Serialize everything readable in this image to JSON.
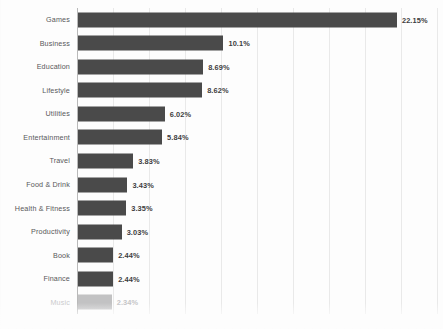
{
  "chart_data": {
    "type": "bar",
    "orientation": "horizontal",
    "title": "",
    "subtitle": "",
    "xlabel": "",
    "ylabel": "",
    "xlim": [
      0,
      25
    ],
    "grid": true,
    "legend": false,
    "value_suffix": "%",
    "categories": [
      "Games",
      "Business",
      "Education",
      "Lifestyle",
      "Utilities",
      "Entertainment",
      "Travel",
      "Food & Drink",
      "Health & Fitness",
      "Productivity",
      "Book",
      "Finance",
      "Music"
    ],
    "values": [
      22.15,
      10.1,
      8.69,
      8.62,
      6.02,
      5.84,
      3.83,
      3.43,
      3.35,
      3.03,
      2.44,
      2.44,
      2.34
    ],
    "data_labels": [
      "22.15%",
      "10.1%",
      "8.69%",
      "8.62%",
      "6.02%",
      "5.84%",
      "3.83%",
      "3.43%",
      "3.35%",
      "3.03%",
      "2.44%",
      "2.44%",
      "2.34%"
    ],
    "faded_rows": [
      12
    ],
    "gridline_values": [
      2.5,
      5,
      7.5,
      10,
      12.5,
      15,
      17.5,
      20,
      22.5,
      25
    ],
    "colors": {
      "bar": "#4a4a4a",
      "bar_faded": "#9e9e9f",
      "background": "#fdfdfd",
      "gridline": "#e9e9e9",
      "axis": "#b9b9b9",
      "category_label": "#58585a",
      "value_label": "#3d3d3f"
    }
  }
}
